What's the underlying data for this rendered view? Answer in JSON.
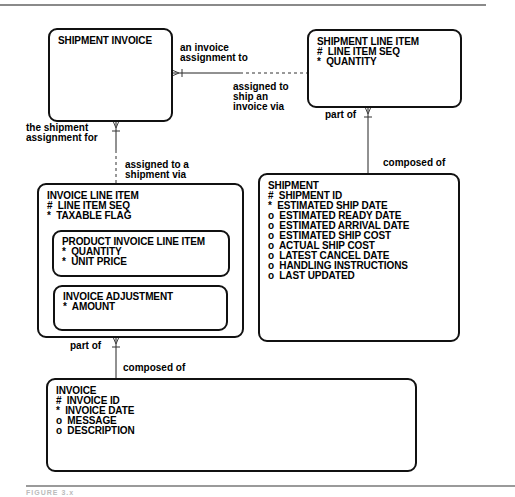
{
  "diagram": {
    "type": "entity-relationship",
    "caption": "FIGURE 3.x"
  },
  "entities": {
    "shipment_invoice": {
      "name": "SHIPMENT INVOICE",
      "attributes": []
    },
    "shipment_line_item": {
      "name": "SHIPMENT LINE ITEM",
      "attributes": [
        "#  LINE ITEM SEQ",
        "*  QUANTITY"
      ]
    },
    "invoice_line_item": {
      "name": "INVOICE LINE ITEM",
      "attributes": [
        "#  LINE ITEM SEQ",
        "*  TAXABLE FLAG"
      ],
      "subtypes": {
        "product_invoice_line_item": {
          "name": "PRODUCT INVOICE LINE ITEM",
          "attributes": [
            "*  QUANTITY",
            "*  UNIT PRICE"
          ]
        },
        "invoice_adjustment": {
          "name": "INVOICE ADJUSTMENT",
          "attributes": [
            "*  AMOUNT"
          ]
        }
      }
    },
    "shipment": {
      "name": "SHIPMENT",
      "attributes": [
        "#  SHIPMENT ID",
        "*  ESTIMATED SHIP DATE",
        "o  ESTIMATED READY DATE",
        "o  ESTIMATED ARRIVAL DATE",
        "o  ESTIMATED SHIP COST",
        "o  ACTUAL SHIP COST",
        "o  LATEST CANCEL DATE",
        "o  HANDLING INSTRUCTIONS",
        "o  LAST UPDATED"
      ]
    },
    "invoice": {
      "name": "INVOICE",
      "attributes": [
        "#  INVOICE ID",
        "*  INVOICE DATE",
        "o  MESSAGE",
        "o  DESCRIPTION"
      ]
    }
  },
  "relationships": {
    "si_sli": {
      "from_label": "an invoice\nassignment to",
      "from_label_lines": [
        "an invoice",
        "assignment to"
      ],
      "to_label_lines": [
        "assigned to",
        "ship an",
        "invoice via"
      ]
    },
    "si_ili": {
      "from_label_lines": [
        "the shipment",
        "assignment for"
      ],
      "to_label_lines": [
        "assigned to a",
        "shipment via"
      ]
    },
    "sli_shipment": {
      "from_label": "part of",
      "to_label": "composed of"
    },
    "ili_invoice": {
      "from_label": "part of",
      "to_label": "composed of"
    }
  }
}
